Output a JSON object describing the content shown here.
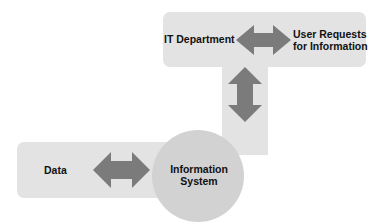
{
  "diagram": {
    "nodes": [
      {
        "id": "it",
        "label": "IT Department"
      },
      {
        "id": "users",
        "label_line1": "User Requests",
        "label_line2": "for Information"
      },
      {
        "id": "is",
        "label_line1": "Information",
        "label_line2": "System"
      },
      {
        "id": "data",
        "label": "Data"
      }
    ],
    "edges": [
      {
        "from": "it",
        "to": "users",
        "type": "bidirectional"
      },
      {
        "from": "it",
        "to": "is",
        "type": "bidirectional"
      },
      {
        "from": "data",
        "to": "is",
        "type": "bidirectional"
      }
    ],
    "colors": {
      "band": "#e3e3e3",
      "arrow": "#7b7b7b",
      "circle": "#d2d2d2"
    }
  }
}
